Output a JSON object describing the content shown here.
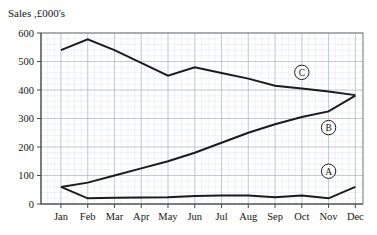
{
  "chart_data": {
    "type": "line",
    "title": "Sales ,£000's",
    "xlabel": "",
    "ylabel": "",
    "ylim": [
      0,
      600
    ],
    "ytick_labels": [
      "0",
      "100",
      "200",
      "300",
      "400",
      "500",
      "600"
    ],
    "ytick_values": [
      0,
      100,
      200,
      300,
      400,
      500,
      600
    ],
    "grid": true,
    "grid_minor": true,
    "legend_position": "inline-annotation",
    "categories": [
      "Jan",
      "Feb",
      "Mar",
      "Apr",
      "May",
      "Jun",
      "Jul",
      "Aug",
      "Sep",
      "Oct",
      "Nov",
      "Dec"
    ],
    "series": [
      {
        "name": "A",
        "label": "A",
        "values": [
          60,
          20,
          22,
          23,
          24,
          28,
          30,
          30,
          24,
          30,
          20,
          60
        ],
        "annotation": {
          "text": "A",
          "x_month": "Nov",
          "y_value": 115
        }
      },
      {
        "name": "B",
        "label": "B",
        "values": [
          60,
          75,
          100,
          125,
          150,
          180,
          215,
          250,
          280,
          305,
          325,
          380
        ],
        "annotation": {
          "text": "B",
          "x_month": "Nov",
          "y_value": 268
        }
      },
      {
        "name": "C",
        "label": "C",
        "values": [
          540,
          578,
          540,
          495,
          450,
          480,
          460,
          440,
          415,
          405,
          395,
          382
        ],
        "annotation": {
          "text": "C",
          "x_month": "Oct",
          "y_value": 462
        }
      }
    ],
    "annotations": [
      {
        "text": "A",
        "shape": "circle"
      },
      {
        "text": "B",
        "shape": "circle"
      },
      {
        "text": "C",
        "shape": "circle"
      }
    ],
    "colors": {
      "line": "#1b1b1b",
      "minor_grid": "#d8dde4",
      "major_grid": "#a8b0bb",
      "frame": "#6a6a6a",
      "text": "#151515",
      "background": "#ffffff"
    }
  }
}
